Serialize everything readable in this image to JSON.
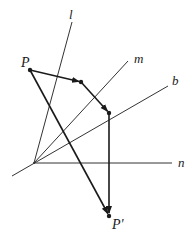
{
  "diagram": {
    "type": "geometric-reflection-composition",
    "colors": {
      "line": "#333333",
      "arrow": "#1a1a1a",
      "background": "#ffffff"
    },
    "lines": [
      {
        "name": "l",
        "label": "l",
        "x1": 34,
        "y1": 163,
        "x2": 72,
        "y2": 22
      },
      {
        "name": "m",
        "label": "m",
        "x1": 34,
        "y1": 163,
        "x2": 128,
        "y2": 61
      },
      {
        "name": "b",
        "label": "b",
        "x1": 12,
        "y1": 176,
        "x2": 168,
        "y2": 86
      },
      {
        "name": "n",
        "label": "n",
        "x1": 34,
        "y1": 163,
        "x2": 172,
        "y2": 163
      }
    ],
    "points": [
      {
        "name": "P",
        "label": "P",
        "x": 30,
        "y": 70
      },
      {
        "name": "Q1",
        "label": "",
        "x": 81,
        "y": 82
      },
      {
        "name": "Q2",
        "label": "",
        "x": 109,
        "y": 113
      },
      {
        "name": "P-prime",
        "label": "P'",
        "x": 109,
        "y": 216
      }
    ],
    "arrows": [
      {
        "from": "P",
        "to": "Q1"
      },
      {
        "from": "Q1",
        "to": "Q2"
      },
      {
        "from": "Q2",
        "to": "P-prime"
      },
      {
        "from": "P",
        "to": "P-prime"
      }
    ],
    "labels": {
      "l": "l",
      "m": "m",
      "b": "b",
      "n": "n",
      "P": "P",
      "P_prime": "P'"
    }
  }
}
